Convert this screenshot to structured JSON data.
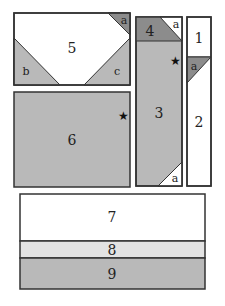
{
  "diagram": {
    "colors": {
      "white": "#ffffff",
      "light_gray": "#e3e3e3",
      "medium_gray": "#b9b9b9",
      "dark_gray": "#8c8c8c",
      "outline": "#333333",
      "star": "#111111"
    },
    "pieces": {
      "p1": {
        "label": "1",
        "fill": "white"
      },
      "p2": {
        "label": "2",
        "fill": "white"
      },
      "p3": {
        "label": "3",
        "fill": "medium_gray",
        "marker": "★"
      },
      "p4": {
        "label": "4",
        "fill": "dark_gray"
      },
      "p5": {
        "label": "5",
        "fill": "white"
      },
      "p6": {
        "label": "6",
        "fill": "medium_gray",
        "marker": "★"
      },
      "p7": {
        "label": "7",
        "fill": "white"
      },
      "p8": {
        "label": "8",
        "fill": "light_gray"
      },
      "p9": {
        "label": "9",
        "fill": "medium_gray"
      }
    },
    "corner_pieces": {
      "a_top_5": {
        "label": "a",
        "fill": "dark_gray"
      },
      "b_5": {
        "label": "b",
        "fill": "medium_gray"
      },
      "c_5": {
        "label": "c",
        "fill": "medium_gray"
      },
      "a_top_4": {
        "label": "a",
        "fill": "white"
      },
      "a_strip_1_2": {
        "label": "a",
        "fill": "dark_gray"
      },
      "a_bottom_3": {
        "label": "a",
        "fill": "white"
      }
    }
  }
}
